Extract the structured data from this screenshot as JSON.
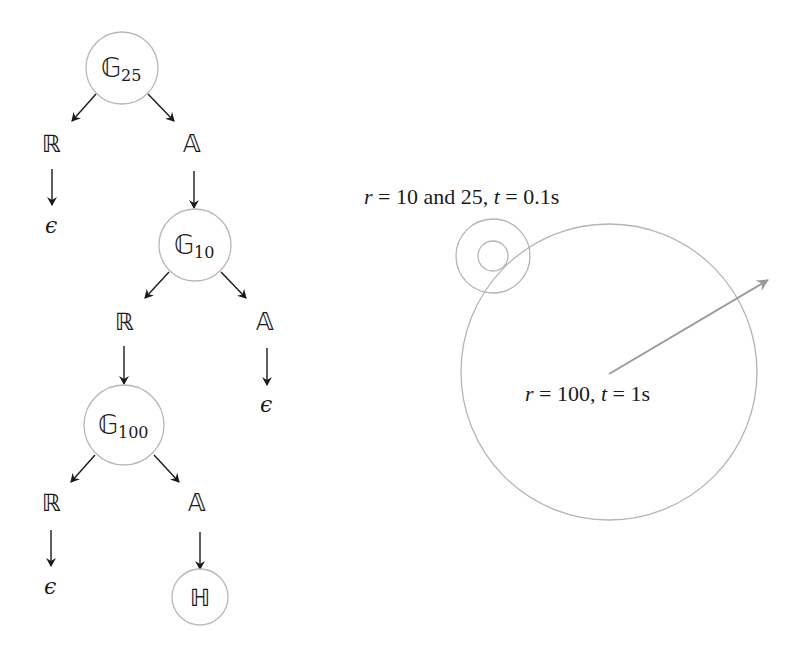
{
  "tree": {
    "nodes": [
      {
        "id": "G25",
        "symbol": "𝔾",
        "subscript": "25",
        "kind": "circle-node"
      },
      {
        "id": "R1",
        "symbol": "ℝ",
        "kind": "label"
      },
      {
        "id": "A1",
        "symbol": "𝔸",
        "kind": "label"
      },
      {
        "id": "eps1",
        "symbol": "ϵ",
        "kind": "terminal"
      },
      {
        "id": "G10",
        "symbol": "𝔾",
        "subscript": "10",
        "kind": "circle-node"
      },
      {
        "id": "R2",
        "symbol": "ℝ",
        "kind": "label"
      },
      {
        "id": "A2",
        "symbol": "𝔸",
        "kind": "label"
      },
      {
        "id": "eps2",
        "symbol": "ϵ",
        "kind": "terminal"
      },
      {
        "id": "G100",
        "symbol": "𝔾",
        "subscript": "100",
        "kind": "circle-node"
      },
      {
        "id": "R3",
        "symbol": "ℝ",
        "kind": "label"
      },
      {
        "id": "A3",
        "symbol": "𝔸",
        "kind": "label"
      },
      {
        "id": "eps3",
        "symbol": "ϵ",
        "kind": "terminal"
      },
      {
        "id": "H",
        "symbol": "ℍ",
        "kind": "circle-node"
      }
    ],
    "edges": [
      [
        "G25",
        "R1"
      ],
      [
        "G25",
        "A1"
      ],
      [
        "R1",
        "eps1"
      ],
      [
        "A1",
        "G10"
      ],
      [
        "G10",
        "R2"
      ],
      [
        "G10",
        "A2"
      ],
      [
        "A2",
        "eps2"
      ],
      [
        "R2",
        "G100"
      ],
      [
        "G100",
        "R3"
      ],
      [
        "G100",
        "A3"
      ],
      [
        "R3",
        "eps3"
      ],
      [
        "A3",
        "H"
      ]
    ]
  },
  "circles_figure": {
    "small_label": {
      "r_var": "r",
      "eq1": " = 10 and 25, ",
      "t_var": "t",
      "eq2": " = 0.1s"
    },
    "large_label": {
      "r_var": "r",
      "eq1": " = 100, ",
      "t_var": "t",
      "eq2": " = 1s"
    },
    "radii": [
      10,
      25,
      100
    ],
    "times": [
      "0.1s",
      "1s"
    ],
    "stroke_color": "#b4b4b4",
    "arrow_color": "#9a9a9a"
  }
}
